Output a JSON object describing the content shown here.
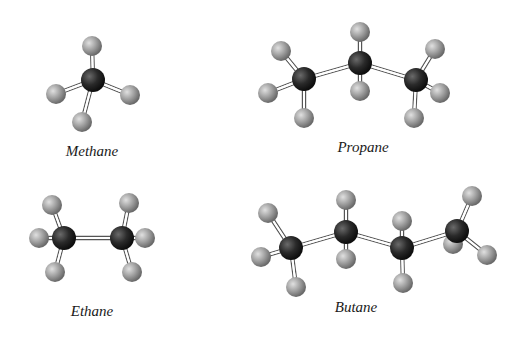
{
  "figure": {
    "molecules": [
      {
        "name": "Methane",
        "carbons": 1,
        "hydrogens": 4
      },
      {
        "name": "Propane",
        "carbons": 3,
        "hydrogens": 8
      },
      {
        "name": "Ethane",
        "carbons": 2,
        "hydrogens": 6
      },
      {
        "name": "Butane",
        "carbons": 4,
        "hydrogens": 10
      }
    ],
    "atom_colors": {
      "carbon": "#1c1c1c",
      "hydrogen": "#9a9a9a"
    }
  }
}
